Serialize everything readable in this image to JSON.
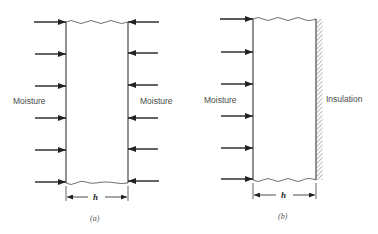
{
  "panels": [
    {
      "id": "a",
      "caption": "(a)",
      "left_label": "Moisture",
      "right_label": "Moisture",
      "dimension_label": "h",
      "description": "Slab exposed to moisture on both faces"
    },
    {
      "id": "b",
      "caption": "(b)",
      "left_label": "Moisture",
      "right_label": "Insulation",
      "dimension_label": "h",
      "description": "Slab exposed to moisture on one face, insulated on the other"
    }
  ],
  "colors": {
    "line": "#222222",
    "text": "#4a4a4a",
    "background": "#ffffff"
  }
}
